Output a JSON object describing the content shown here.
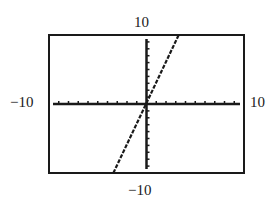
{
  "chart_data": {
    "type": "line",
    "title": "",
    "xlabel": "",
    "ylabel": "",
    "xlim": [
      -10,
      10
    ],
    "ylim": [
      -10,
      10
    ],
    "x_tick_step": 1,
    "y_tick_step": 1,
    "grid": false,
    "window_labels": {
      "ymax": "10",
      "ymin": "−10",
      "xmin": "−10",
      "xmax": "10"
    },
    "series": [
      {
        "name": "y = 3x",
        "style": "dashed",
        "x": [
          -3.4,
          3.3
        ],
        "y": [
          -10,
          10
        ]
      }
    ]
  },
  "frame": {
    "left": 49,
    "top": 35,
    "right": 244,
    "bottom": 173
  },
  "colors": {
    "ink": "#1a1a1a",
    "background": "#ffffff"
  }
}
